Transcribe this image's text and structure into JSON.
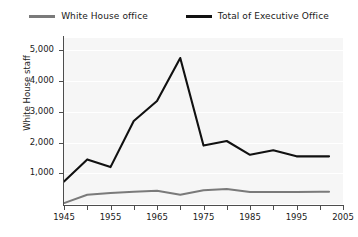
{
  "chart_data": {
    "type": "line",
    "title": "",
    "xlabel": "",
    "ylabel": "White House staff",
    "xlim": [
      1945,
      2005
    ],
    "ylim": [
      0,
      5400
    ],
    "yticks": [
      1000,
      2000,
      3000,
      4000,
      5000
    ],
    "ytick_labels": [
      "1,000",
      "2,000",
      "3,000",
      "4,000",
      "5,000"
    ],
    "xticks": [
      1945,
      1955,
      1965,
      1975,
      1985,
      1995,
      2005
    ],
    "xtick_labels": [
      "1945",
      "1955",
      "1965",
      "1975",
      "1985",
      "1995",
      "2005"
    ],
    "xtick_minor": [
      1950,
      1960,
      1970,
      1980,
      1990,
      2000
    ],
    "grid": true,
    "legend_position": "top",
    "series": [
      {
        "name": "White House office",
        "color": "#7a7a7a",
        "x": [
          1945,
          1950,
          1955,
          1960,
          1965,
          1970,
          1975,
          1980,
          1985,
          1990,
          1995,
          2000,
          2002
        ],
        "values": [
          30,
          300,
          360,
          400,
          430,
          300,
          450,
          490,
          390,
          390,
          390,
          400,
          400
        ]
      },
      {
        "name": "Total of Executive Office",
        "color": "#111111",
        "x": [
          1945,
          1950,
          1955,
          1960,
          1965,
          1970,
          1975,
          1980,
          1985,
          1990,
          1995,
          2000,
          2002
        ],
        "values": [
          730,
          1450,
          1200,
          2700,
          3350,
          4750,
          1900,
          2050,
          1600,
          1750,
          1550,
          1550,
          1550
        ]
      }
    ]
  },
  "legend": {
    "entries": [
      {
        "label": "White House office",
        "color": "#7a7a7a"
      },
      {
        "label": "Total of Executive Office",
        "color": "#111111"
      }
    ]
  }
}
